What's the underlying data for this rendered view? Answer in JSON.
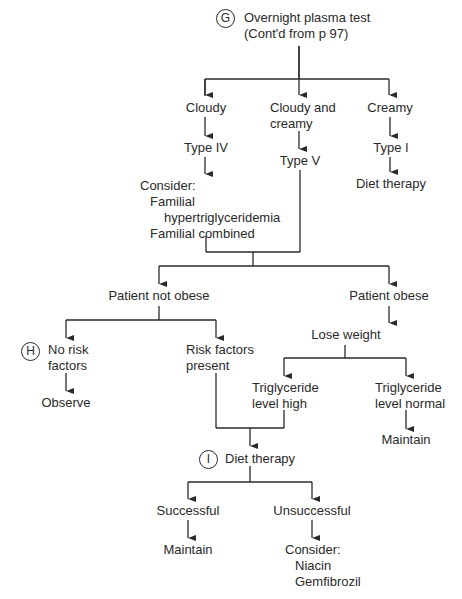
{
  "flowchart": {
    "markers": {
      "G": "G",
      "H": "H",
      "I": "I"
    },
    "root": {
      "line1": "Overnight plasma test",
      "line2": "(Cont'd from p 97)"
    },
    "level1": {
      "cloudy": "Cloudy",
      "cloudy_creamy": {
        "line1": "Cloudy and",
        "line2": "creamy"
      },
      "creamy": "Creamy"
    },
    "types": {
      "type_iv": "Type IV",
      "type_v": "Type V",
      "type_i": "Type I"
    },
    "type_i_action": "Diet therapy",
    "consider_block": {
      "heading": "Consider:",
      "items": [
        "Familial",
        "hypertriglyceridemia",
        "Familial combined"
      ]
    },
    "weight_branch": {
      "not_obese": "Patient not obese",
      "obese": "Patient obese",
      "lose_weight": "Lose weight"
    },
    "risk_branch": {
      "no_risk": {
        "line1": "No risk",
        "line2": "factors"
      },
      "risk_present": {
        "line1": "Risk factors",
        "line2": "present"
      },
      "observe": "Observe"
    },
    "triglyceride_branch": {
      "high": {
        "line1": "Triglyceride",
        "line2": "level high"
      },
      "normal": {
        "line1": "Triglyceride",
        "line2": "level normal"
      },
      "maintain": "Maintain"
    },
    "diet_therapy": "Diet therapy",
    "outcomes": {
      "successful": "Successful",
      "unsuccessful": "Unsuccessful",
      "maintain": "Maintain",
      "consider_heading": "Consider:",
      "consider_items": [
        "Niacin",
        "Gemfibrozil"
      ]
    },
    "line_color": "#2a2a2a"
  }
}
